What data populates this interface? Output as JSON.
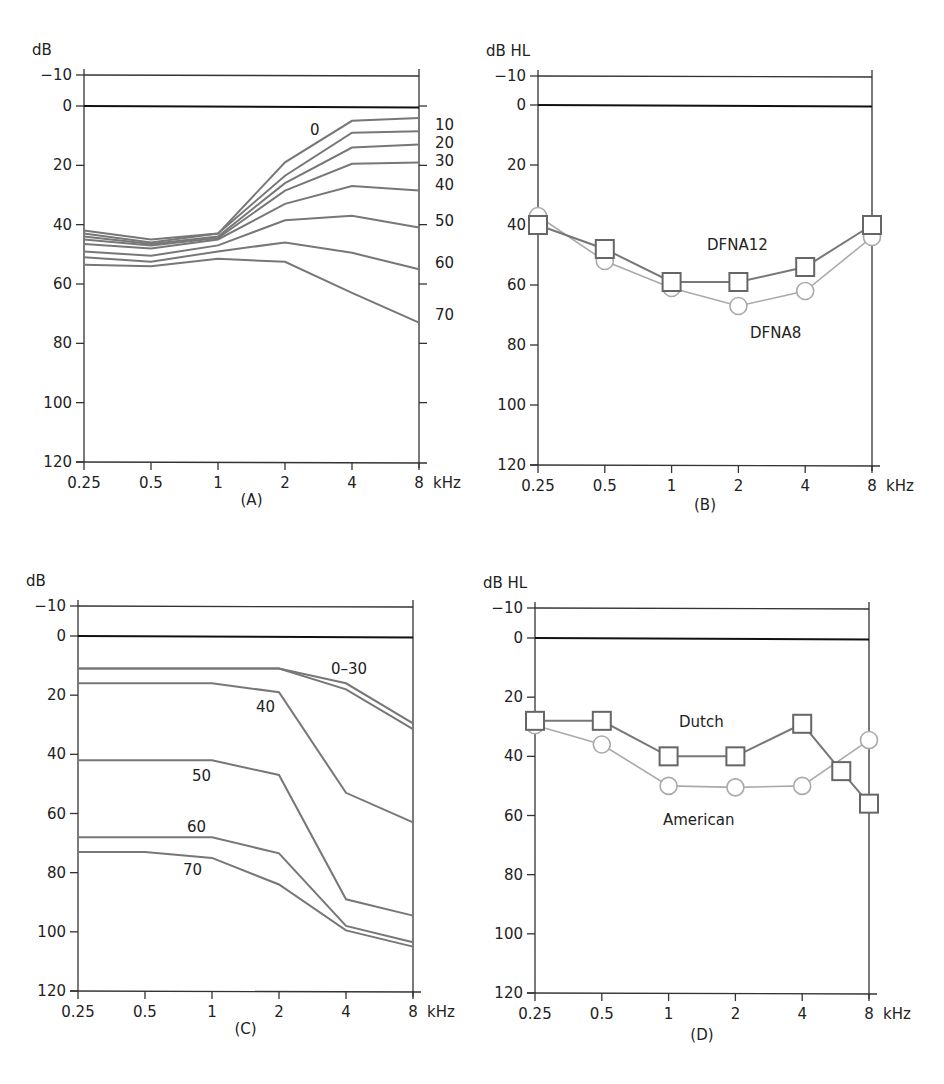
{
  "chart_data": [
    {
      "panel": "A",
      "type": "line",
      "title": "",
      "panel_label": "(A)",
      "ylabel": "dB",
      "xlabel": "kHz",
      "x": [
        0.25,
        0.5,
        1,
        2,
        4,
        8
      ],
      "x_tick_labels": [
        "0.25",
        "0.5",
        "1",
        "2",
        "4",
        "8"
      ],
      "y_ticks": [
        -10,
        0,
        20,
        40,
        60,
        80,
        100,
        120
      ],
      "ylim": [
        -10,
        120
      ],
      "y_inverted": true,
      "right_axis_labels": [
        "0",
        "10",
        "20",
        "30",
        "40",
        "50",
        "60",
        "70"
      ],
      "series": [
        {
          "name": "0",
          "values": [
            42,
            45,
            43,
            19,
            5,
            4
          ]
        },
        {
          "name": "10",
          "values": [
            43,
            46,
            43,
            23.5,
            9,
            8.5
          ]
        },
        {
          "name": "20",
          "values": [
            44,
            46.5,
            44,
            26,
            14,
            13
          ]
        },
        {
          "name": "30",
          "values": [
            45,
            47,
            44.5,
            28.5,
            19.5,
            19
          ]
        },
        {
          "name": "40",
          "values": [
            46.5,
            48,
            45,
            33,
            27,
            28.5
          ]
        },
        {
          "name": "50",
          "values": [
            49,
            50.5,
            47,
            38.5,
            37,
            41
          ]
        },
        {
          "name": "60",
          "values": [
            51,
            52.5,
            49,
            46,
            49.5,
            55
          ]
        },
        {
          "name": "70",
          "values": [
            53.5,
            54,
            51.5,
            52.5,
            63,
            73
          ]
        }
      ]
    },
    {
      "panel": "B",
      "type": "line",
      "title": "",
      "panel_label": "(B)",
      "ylabel": "dB HL",
      "xlabel": "kHz",
      "x": [
        0.25,
        0.5,
        1,
        2,
        4,
        8
      ],
      "x_tick_labels": [
        "0.25",
        "0.5",
        "1",
        "2",
        "4",
        "8"
      ],
      "y_ticks": [
        -10,
        0,
        20,
        40,
        60,
        80,
        100,
        120
      ],
      "ylim": [
        -10,
        120
      ],
      "y_inverted": true,
      "series": [
        {
          "name": "DFNA12",
          "marker": "square",
          "values": [
            40,
            48,
            59,
            59,
            54,
            40
          ]
        },
        {
          "name": "DFNA8",
          "marker": "circle",
          "values": [
            37,
            52,
            61,
            67,
            62,
            44
          ]
        }
      ]
    },
    {
      "panel": "C",
      "type": "line",
      "title": "",
      "panel_label": "(C)",
      "ylabel": "dB",
      "xlabel": "kHz",
      "x": [
        0.25,
        0.5,
        1,
        2,
        4,
        8
      ],
      "x_tick_labels": [
        "0.25",
        "0.5",
        "1",
        "2",
        "4",
        "8"
      ],
      "y_ticks": [
        -10,
        0,
        20,
        40,
        60,
        80,
        100,
        120
      ],
      "ylim": [
        -10,
        120
      ],
      "y_inverted": true,
      "series": [
        {
          "name": "0–30 (a)",
          "values": [
            11,
            11,
            11,
            11,
            16,
            29.5
          ]
        },
        {
          "name": "0–30 (b)",
          "values": [
            11,
            11,
            11,
            11,
            18,
            31.5
          ]
        },
        {
          "name": "40",
          "values": [
            16,
            16,
            16,
            19,
            53,
            63
          ]
        },
        {
          "name": "50",
          "values": [
            42,
            42,
            42,
            47,
            89,
            94.5
          ]
        },
        {
          "name": "60",
          "values": [
            68,
            68,
            68,
            73.5,
            98,
            103.5
          ]
        },
        {
          "name": "70",
          "values": [
            73,
            73,
            75,
            84,
            99.5,
            105
          ]
        }
      ],
      "annotations": [
        "0–30",
        "40",
        "50",
        "60",
        "70"
      ]
    },
    {
      "panel": "D",
      "type": "line",
      "title": "",
      "panel_label": "(D)",
      "ylabel": "dB HL",
      "xlabel": "kHz",
      "x_tick_labels": [
        "0.25",
        "0.5",
        "1",
        "2",
        "4",
        "8"
      ],
      "y_ticks": [
        -10,
        0,
        20,
        40,
        60,
        80,
        100,
        120
      ],
      "ylim": [
        -10,
        120
      ],
      "y_inverted": true,
      "series": [
        {
          "name": "Dutch",
          "marker": "square",
          "x": [
            0.25,
            0.5,
            1,
            2,
            4,
            6,
            8
          ],
          "values": [
            28,
            28,
            40,
            40,
            29,
            45,
            56
          ]
        },
        {
          "name": "American",
          "marker": "circle",
          "x": [
            0.25,
            0.5,
            1,
            2,
            4,
            8
          ],
          "values": [
            29.5,
            36,
            50,
            50.5,
            50,
            34.5
          ]
        }
      ]
    }
  ],
  "panels": {
    "A": {
      "unit": "dB",
      "label": "(A)",
      "khz": "kHz"
    },
    "B": {
      "unit": "dB HL",
      "label": "(B)",
      "khz": "kHz",
      "ann1": "DFNA12",
      "ann2": "DFNA8"
    },
    "C": {
      "unit": "dB",
      "label": "(C)",
      "khz": "kHz"
    },
    "D": {
      "unit": "dB HL",
      "label": "(D)",
      "khz": "kHz",
      "ann1": "Dutch",
      "ann2": "American"
    }
  },
  "colors": {
    "dark_series": "#777777",
    "light_series": "#aaaaaa",
    "axis": "#333333"
  }
}
